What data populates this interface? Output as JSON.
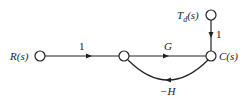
{
  "diagram": {
    "type": "signal-flow-graph",
    "nodes": [
      {
        "id": "R",
        "label": "R(s)",
        "x": 40,
        "y": 56
      },
      {
        "id": "M",
        "label": "",
        "x": 124,
        "y": 56
      },
      {
        "id": "C",
        "label": "C(s)",
        "x": 211,
        "y": 56
      },
      {
        "id": "Td",
        "label": "T_d(s)",
        "x": 211,
        "y": 15
      }
    ],
    "edges": [
      {
        "from": "R",
        "to": "M",
        "gain": "1"
      },
      {
        "from": "M",
        "to": "C",
        "gain": "G"
      },
      {
        "from": "Td",
        "to": "C",
        "gain": "1"
      },
      {
        "from": "C",
        "to": "M",
        "gain": "−H",
        "curved": true
      }
    ],
    "labels": {
      "r": "R(s)",
      "c": "C(s)",
      "td_main": "T",
      "td_sub": "d",
      "td_tail": "(s)",
      "gain_rm": "1",
      "gain_mc": "G",
      "gain_tdc": "1",
      "gain_feedback": "−H"
    }
  }
}
